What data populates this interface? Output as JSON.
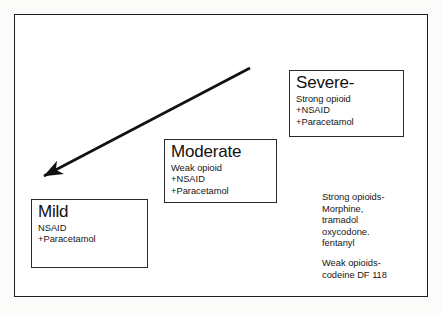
{
  "figure": {
    "kind": "analgesic-ladder-diagram",
    "frame_color": "#1c1c1c",
    "background": "#ffffff"
  },
  "arrow": {
    "name": "severity-gradient-arrow",
    "color": "#111111",
    "from_x": 250,
    "from_y": 68,
    "to_x": 40,
    "to_y": 178,
    "head_at": "lower-left"
  },
  "cards": {
    "severe": {
      "title": "Severe-",
      "lines": [
        "Strong opioid",
        "+NSAID",
        "+Paracetamol"
      ]
    },
    "moderate": {
      "title": "Moderate",
      "lines": [
        "Weak opioid",
        "+NSAID",
        "+Paracetamol"
      ]
    },
    "mild": {
      "title": "Mild",
      "lines": [
        "NSAID",
        "+Paracetamol"
      ]
    }
  },
  "notes": {
    "strong": [
      "Strong opioids-",
      "Morphine,",
      "tramadol",
      "oxycodone.",
      "fentanyl"
    ],
    "weak": [
      "Weak opioids-",
      "codeine DF 118"
    ]
  }
}
